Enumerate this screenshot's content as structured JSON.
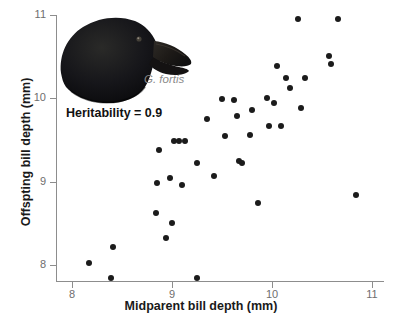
{
  "chart_data": {
    "type": "scatter",
    "title": "",
    "xlabel": "Midparent bill depth (mm)",
    "ylabel": "Offspting bill depth (mm)",
    "xlim": [
      7.84,
      11.12
    ],
    "ylim": [
      7.68,
      11.0
    ],
    "xticks": [
      "8",
      "9",
      "10",
      "11"
    ],
    "xtick_values": [
      8,
      9,
      10,
      11
    ],
    "yticks": [
      "8",
      "9",
      "10",
      "11"
    ],
    "ytick_values": [
      8,
      9,
      10,
      11
    ],
    "grid": false,
    "legend": null,
    "marker_color": "#1b1b1b",
    "axis_color": "#8d8d8d",
    "annotations": [
      {
        "name": "heritability",
        "text": "Heritability = 0.9"
      },
      {
        "name": "species",
        "text": "G. fortis"
      }
    ],
    "series": [
      {
        "name": "Geospiza fortis parent-offspring pairs",
        "points": [
          [
            8.17,
            8.02
          ],
          [
            8.39,
            7.84
          ],
          [
            8.41,
            8.22
          ],
          [
            8.84,
            8.62
          ],
          [
            8.85,
            8.98
          ],
          [
            8.87,
            9.38
          ],
          [
            8.94,
            8.32
          ],
          [
            8.98,
            9.05
          ],
          [
            9.0,
            8.5
          ],
          [
            9.02,
            9.49
          ],
          [
            9.07,
            9.49
          ],
          [
            9.1,
            8.96
          ],
          [
            9.13,
            9.49
          ],
          [
            9.25,
            7.84
          ],
          [
            9.25,
            9.23
          ],
          [
            9.35,
            9.75
          ],
          [
            9.42,
            9.07
          ],
          [
            9.5,
            9.99
          ],
          [
            9.53,
            9.55
          ],
          [
            9.62,
            9.98
          ],
          [
            9.65,
            9.79
          ],
          [
            9.67,
            9.25
          ],
          [
            9.7,
            9.22
          ],
          [
            9.78,
            9.56
          ],
          [
            9.8,
            9.86
          ],
          [
            9.86,
            8.74
          ],
          [
            9.95,
            10.0
          ],
          [
            9.97,
            9.67
          ],
          [
            10.02,
            9.94
          ],
          [
            10.05,
            10.39
          ],
          [
            10.09,
            9.67
          ],
          [
            10.14,
            10.24
          ],
          [
            10.18,
            10.13
          ],
          [
            10.26,
            10.95
          ],
          [
            10.29,
            9.88
          ],
          [
            10.33,
            10.25
          ],
          [
            10.57,
            10.51
          ],
          [
            10.59,
            10.41
          ],
          [
            10.66,
            10.95
          ],
          [
            10.84,
            8.84
          ]
        ]
      }
    ]
  }
}
